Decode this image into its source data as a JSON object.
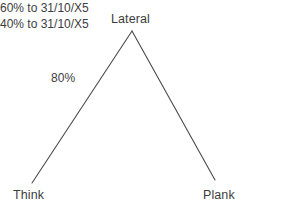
{
  "diagram": {
    "type": "group-structure-tree",
    "background_color": "#ffffff",
    "line_color": "#4a4a4a",
    "text_color": "#3d3d3d",
    "nodes": {
      "parent": {
        "label": "Lateral"
      },
      "left_child": {
        "label": "Think"
      },
      "right_child": {
        "label": "Plank"
      }
    },
    "edges": {
      "left": {
        "from": "Lateral",
        "to": "Think",
        "label": "80%"
      },
      "right": {
        "from": "Lateral",
        "to": "Plank",
        "labels": [
          "60% to 31/10/X5",
          "40% to 31/10/X5"
        ]
      }
    }
  }
}
